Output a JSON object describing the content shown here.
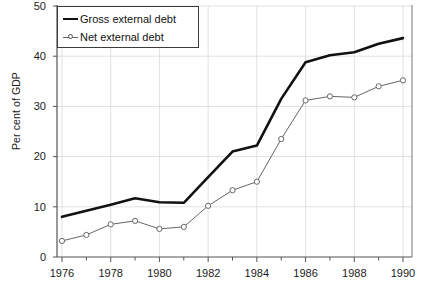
{
  "chart_data": {
    "type": "line",
    "title": "",
    "xlabel": "",
    "ylabel": "Per cent of GDP",
    "xlim": [
      1975.5,
      1990.5
    ],
    "ylim": [
      0,
      50
    ],
    "grid": true,
    "legend_position": "top-left",
    "x": [
      1976,
      1977,
      1978,
      1979,
      1980,
      1981,
      1982,
      1983,
      1984,
      1985,
      1986,
      1987,
      1988,
      1989,
      1990
    ],
    "xticks": [
      1976,
      1978,
      1980,
      1982,
      1984,
      1986,
      1988,
      1990
    ],
    "xtick_labels": [
      "1976",
      "1978",
      "1980",
      "1982",
      "1984",
      "1986",
      "1988",
      "1990"
    ],
    "yticks": [
      0,
      10,
      20,
      30,
      40,
      50
    ],
    "ytick_labels": [
      "0",
      "10",
      "20",
      "30",
      "40",
      "50"
    ],
    "series": [
      {
        "name": "Gross external debt",
        "style": "thick-solid",
        "color": "#111111",
        "marker": "none",
        "values": [
          8.0,
          9.2,
          10.4,
          11.7,
          10.9,
          10.8,
          15.9,
          21.0,
          22.2,
          31.5,
          38.8,
          40.2,
          40.8,
          42.5,
          43.6
        ]
      },
      {
        "name": "Net external debt",
        "style": "thin-solid",
        "color": "#666666",
        "marker": "open-circle",
        "values": [
          3.2,
          4.4,
          6.5,
          7.2,
          5.6,
          6.0,
          10.2,
          13.3,
          15.0,
          23.5,
          31.2,
          32.0,
          31.8,
          34.0,
          35.2
        ]
      }
    ]
  },
  "legend": {
    "entries": [
      {
        "label": "Gross external debt"
      },
      {
        "label": "Net external debt"
      }
    ]
  },
  "axes": {
    "y_axis_title": "Per cent of GDP"
  }
}
